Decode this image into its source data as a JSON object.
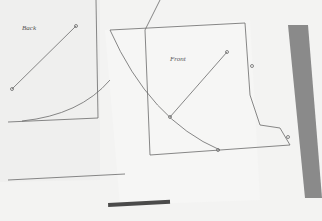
{
  "photo": {
    "subject": "sewing pattern pieces on paper",
    "pieces": [
      {
        "label": "Back"
      },
      {
        "label": "Front"
      }
    ],
    "colors": {
      "paper": "#f2f2f1",
      "line": "#6a6a6a",
      "ruler": "#8a8a8a",
      "scale_bar": "#4a4a4a"
    }
  }
}
